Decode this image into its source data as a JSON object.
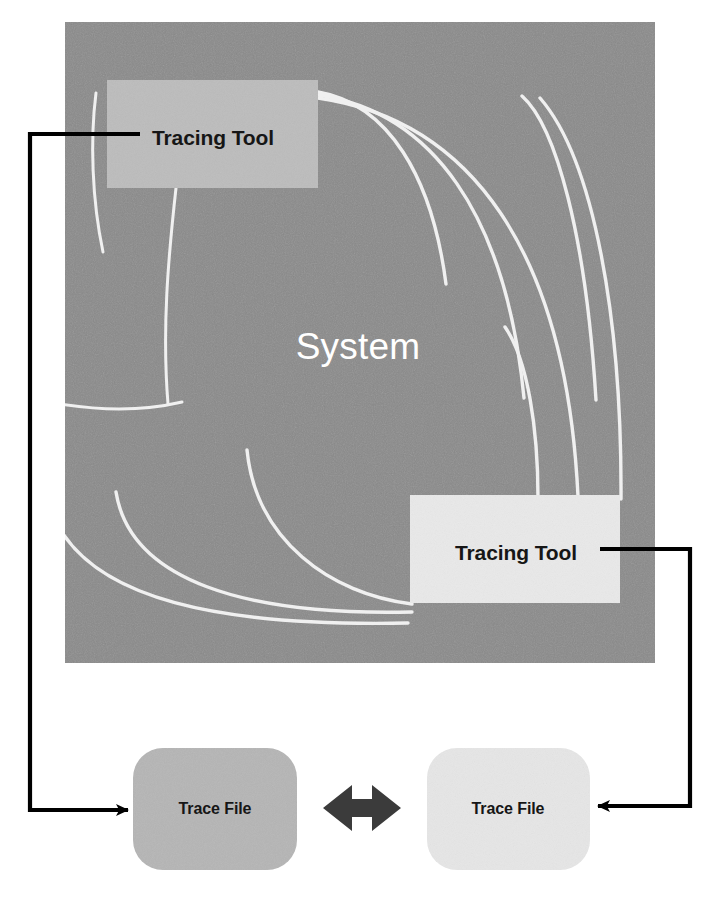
{
  "diagram": {
    "system": {
      "label": "System",
      "label_color": "#ffffff",
      "fill": "#8a8a8a",
      "bounds": {
        "x": 65,
        "y": 22,
        "width": 590,
        "height": 641
      }
    },
    "tracing_tools": [
      {
        "id": "tracing-tool-top-left",
        "label": "Tracing Tool",
        "fill": "#bcbcbc",
        "text_color": "#1a1a1a",
        "bounds": {
          "x": 107,
          "y": 80,
          "width": 211,
          "height": 108
        }
      },
      {
        "id": "tracing-tool-bottom-right",
        "label": "Tracing Tool",
        "fill": "#e9e9e9",
        "text_color": "#1a1a1a",
        "bounds": {
          "x": 410,
          "y": 495,
          "width": 210,
          "height": 108
        }
      }
    ],
    "trace_files": [
      {
        "id": "trace-file-left",
        "label": "Trace File",
        "fill": "#b5b5b5",
        "text_color": "#1a1a1a",
        "bounds": {
          "x": 133,
          "y": 748,
          "width": 164,
          "height": 122
        },
        "corner_radius": 28
      },
      {
        "id": "trace-file-right",
        "label": "Trace File",
        "fill": "#e6e6e6",
        "text_color": "#1a1a1a",
        "bounds": {
          "x": 427,
          "y": 748,
          "width": 163,
          "height": 122
        },
        "corner_radius": 28
      }
    ],
    "connectors": [
      {
        "id": "connector-left",
        "from": "tracing-tool-top-left",
        "to": "trace-file-left",
        "color": "#000000",
        "arrow_at": "trace-file-left"
      },
      {
        "id": "connector-right",
        "from": "tracing-tool-bottom-right",
        "to": "trace-file-right",
        "color": "#000000",
        "arrow_at": "trace-file-right"
      }
    ],
    "exchange_arrow": {
      "id": "trace-file-exchange-arrow",
      "direction": "bidirectional",
      "color": "#3b3b3b",
      "bounds": {
        "x": 323,
        "y": 784,
        "width": 78,
        "height": 48
      }
    },
    "system_traces": {
      "color": "#f2f2f2",
      "description": "white curved trace paths fanning through the system region"
    }
  }
}
